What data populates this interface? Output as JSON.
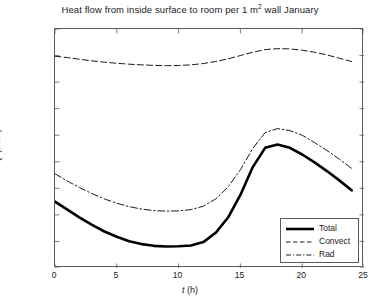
{
  "chart_data": {
    "type": "line",
    "title_parts": {
      "before": "Heat flow from inside surface to room per 1 m",
      "sup": "2",
      "after": " wall January"
    },
    "xlabel": "t (h)",
    "xlabel_parts": {
      "symbol": "t",
      "unit": " (h)"
    },
    "ylabel": "Q (J/m²)",
    "ylabel_parts": {
      "symbol": "Q",
      "unit_open": " (J/m",
      "sup": "2",
      "unit_close": ")"
    },
    "xlim": [
      0,
      25
    ],
    "ylim": [
      -18000,
      0
    ],
    "xticks": [
      0,
      5,
      10,
      15,
      20,
      25
    ],
    "xtick_labels": [
      "0",
      "5",
      "10",
      "15",
      "20",
      "25"
    ],
    "yticks": [
      0,
      -2000,
      -4000,
      -6000,
      -8000,
      -10000,
      -12000,
      -14000,
      -16000,
      -18000
    ],
    "ytick_labels": [
      "0",
      "-2000",
      "-4000",
      "-6000",
      "-8000",
      "-10,000",
      "-12,000",
      "-14,000",
      "-16,000",
      "-18,000"
    ],
    "grid": false,
    "tick_direction": "in",
    "legend_position": "lower right",
    "x": [
      0,
      1,
      2,
      3,
      4,
      5,
      6,
      7,
      8,
      9,
      10,
      11,
      12,
      13,
      14,
      15,
      16,
      17,
      18,
      19,
      20,
      21,
      22,
      23,
      24
    ],
    "series": [
      {
        "name": "Total",
        "style": "solid",
        "width": 2.6,
        "color": "#000000",
        "values": [
          -13000,
          -13600,
          -14200,
          -14750,
          -15250,
          -15650,
          -15980,
          -16200,
          -16330,
          -16380,
          -16360,
          -16300,
          -16050,
          -15350,
          -14200,
          -12500,
          -10400,
          -8950,
          -8700,
          -8950,
          -9450,
          -10050,
          -10700,
          -11400,
          -12150
        ]
      },
      {
        "name": "Convect",
        "style": "dashed",
        "width": 1.0,
        "color": "#1a1a1a",
        "values": [
          -2050,
          -2150,
          -2280,
          -2400,
          -2500,
          -2580,
          -2650,
          -2700,
          -2740,
          -2760,
          -2750,
          -2700,
          -2600,
          -2450,
          -2250,
          -2000,
          -1750,
          -1550,
          -1480,
          -1500,
          -1600,
          -1750,
          -1950,
          -2200,
          -2450
        ]
      },
      {
        "name": "Rad",
        "style": "dashdot",
        "width": 1.0,
        "color": "#1a1a1a",
        "values": [
          -10900,
          -11450,
          -11950,
          -12400,
          -12800,
          -13120,
          -13380,
          -13560,
          -13680,
          -13720,
          -13700,
          -13600,
          -13350,
          -12800,
          -11900,
          -10600,
          -9000,
          -7800,
          -7500,
          -7650,
          -8000,
          -8550,
          -9150,
          -9800,
          -10500
        ]
      }
    ]
  },
  "legend": {
    "items": [
      {
        "label": "Total"
      },
      {
        "label": "Convect"
      },
      {
        "label": "Rad"
      }
    ]
  }
}
